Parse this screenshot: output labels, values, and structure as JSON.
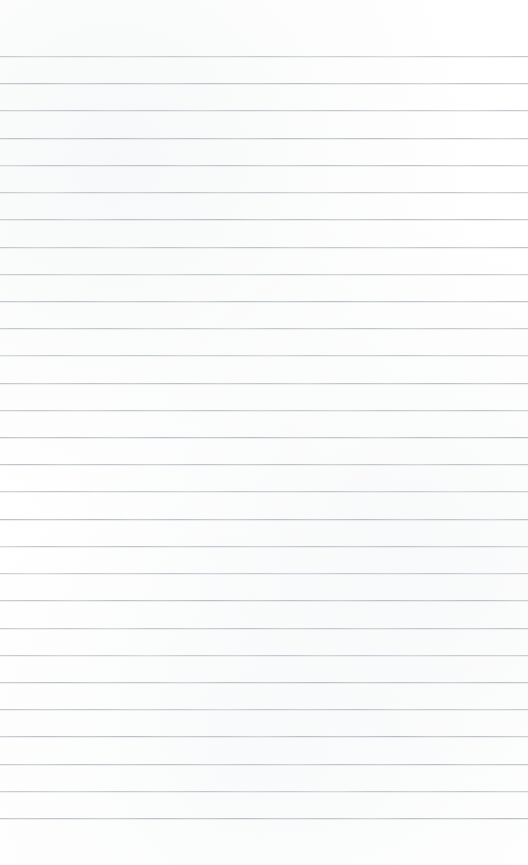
{
  "document": {
    "kind": "lined-paper-scan",
    "title": "Blank ruled notebook page",
    "page_width_px": 528,
    "page_height_px": 865,
    "background_color": "#ffffff",
    "has_text_content": false,
    "visible_text": ""
  },
  "ruling": {
    "line_color": "#c3c7cc",
    "line_thickness_px": 1,
    "line_count": 29,
    "first_line_y_px": 56,
    "last_line_y_px": 818,
    "line_spacing_px": 27.2,
    "line_start_x_px": 0,
    "line_end_x_px": 528,
    "top_margin_px": 56,
    "bottom_margin_px": 46,
    "left_margin_px": 0,
    "right_margin_px": 0,
    "has_vertical_margin_rule": false,
    "lines_y": [
      56,
      83.2,
      110.4,
      137.6,
      164.9,
      192.1,
      219.3,
      246.5,
      273.7,
      300.9,
      328.1,
      355.4,
      382.6,
      409.8,
      437.0,
      464.2,
      491.4,
      518.6,
      545.9,
      573.1,
      600.3,
      627.5,
      654.7,
      681.9,
      709.1,
      736.4,
      763.6,
      790.8,
      818.0
    ]
  }
}
